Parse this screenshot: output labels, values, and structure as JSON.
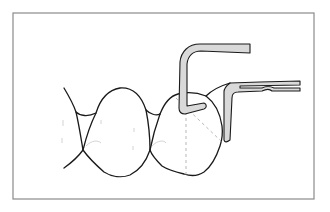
{
  "figure": {
    "title": "",
    "elements": {
      "frame": "border",
      "teeth": [
        "left-tooth-partial",
        "middle-tooth",
        "right-tooth"
      ],
      "instruments": [
        "hooked-probe",
        "matrix-arm"
      ],
      "guides": [
        "vertical-dashed-axis",
        "diagonal-dashed-axis"
      ]
    },
    "colors": {
      "line": "#1a1a1a",
      "instrument_fill": "#d9d9d9",
      "frame": "#8a8a8a",
      "guide": "#9a9a9a",
      "background": "#ffffff"
    }
  }
}
